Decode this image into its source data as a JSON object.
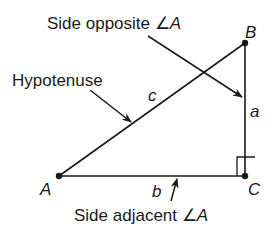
{
  "diagram": {
    "type": "right-triangle",
    "stroke_color": "#1a1a1a",
    "background": "#ffffff",
    "vertices": [
      {
        "label": "A",
        "x": 59,
        "y": 176
      },
      {
        "label": "B",
        "x": 245,
        "y": 43
      },
      {
        "label": "C",
        "x": 245,
        "y": 176
      }
    ],
    "sides": [
      {
        "label": "c",
        "from": "A",
        "to": "B",
        "role": "Hypotenuse"
      },
      {
        "label": "a",
        "from": "B",
        "to": "C",
        "role": "Side opposite ∠A"
      },
      {
        "label": "b",
        "from": "A",
        "to": "C",
        "role": "Side adjacent ∠A"
      }
    ],
    "right_angle_at": "C",
    "annotations": {
      "opposite": {
        "text_prefix": "Side opposite",
        "angle_symbol": "∠",
        "angle_label": "A"
      },
      "hypotenuse": {
        "text": "Hypotenuse"
      },
      "adjacent": {
        "text_prefix": "Side adjacent",
        "angle_symbol": "∠",
        "angle_label": "A"
      }
    }
  }
}
